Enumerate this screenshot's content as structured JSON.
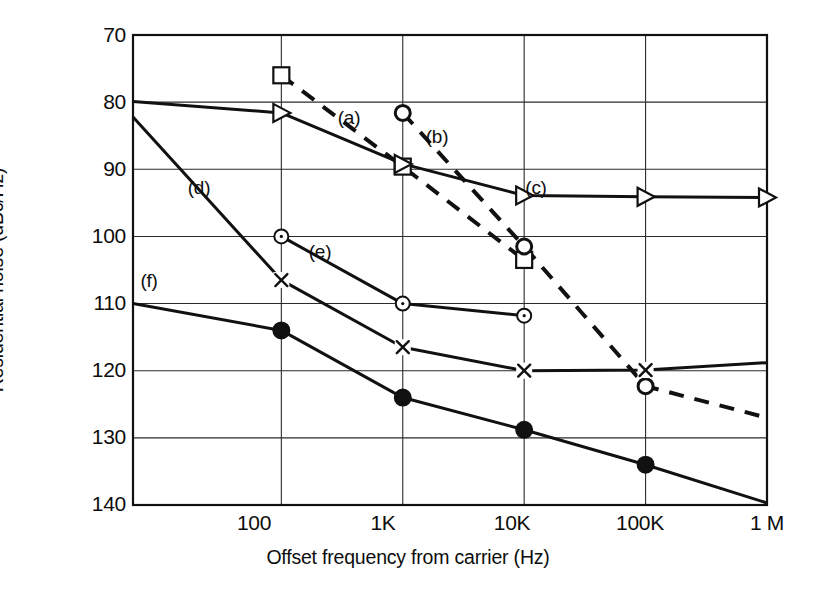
{
  "chart_data": {
    "type": "line",
    "title": "",
    "xlabel": "Offset frequency from carrier (Hz)",
    "ylabel": "Residential noise (dBc/Hz)",
    "x_scale": "log",
    "x_tick_labels": [
      "100",
      "1K",
      "10K",
      "100K",
      "1 M"
    ],
    "x_tick_values": [
      100,
      1000,
      10000,
      100000,
      1000000
    ],
    "xlim": [
      6,
      1000000
    ],
    "y_tick_labels": [
      "70",
      "80",
      "90",
      "100",
      "110",
      "120",
      "130",
      "140"
    ],
    "y_tick_values": [
      70,
      80,
      90,
      100,
      110,
      120,
      130,
      140
    ],
    "ylim": [
      70,
      140
    ],
    "y_inverted": true,
    "grid": true,
    "legend": "inline-annotations",
    "series": [
      {
        "name": "(a)",
        "label": "(a)",
        "marker": "square-open",
        "line": "dashed",
        "x": [
          100,
          1000,
          10000
        ],
        "values": [
          76.0,
          89.6,
          103.5
        ]
      },
      {
        "name": "(b)",
        "label": "(b)",
        "marker": "circle-open",
        "line": "dashed",
        "x": [
          1000,
          10000,
          100000,
          1000000
        ],
        "values": [
          81.6,
          101.5,
          122.3,
          127.0
        ]
      },
      {
        "name": "(c)",
        "label": "(c)",
        "marker": "triangle-right-open",
        "line": "solid",
        "x": [
          6,
          100,
          1000,
          10000,
          100000,
          1000000
        ],
        "values": [
          79.9,
          81.6,
          89.2,
          93.9,
          94.1,
          94.2
        ]
      },
      {
        "name": "(d)",
        "label": "(d)",
        "marker": "x",
        "line": "solid",
        "x": [
          6,
          100,
          1000,
          10000,
          100000,
          1000000
        ],
        "values": [
          82.2,
          106.5,
          116.5,
          120.0,
          119.9,
          118.8
        ]
      },
      {
        "name": "(e)",
        "label": "(e)",
        "marker": "circle-open-small",
        "line": "solid",
        "x": [
          100,
          1000,
          10000
        ],
        "values": [
          100.0,
          110.0,
          111.8
        ]
      },
      {
        "name": "(f)",
        "label": "(f)",
        "marker": "circle-filled",
        "line": "solid",
        "x": [
          6,
          100,
          1000,
          10000,
          100000,
          1000000
        ],
        "values": [
          110.0,
          114.0,
          124.0,
          128.8,
          134.0,
          139.7
        ]
      }
    ],
    "annotations": [
      {
        "text": "(a)",
        "x_px": 349,
        "y_px": 118
      },
      {
        "text": "(b)",
        "x_px": 437,
        "y_px": 137
      },
      {
        "text": "(c)",
        "x_px": 536,
        "y_px": 188
      },
      {
        "text": "(d)",
        "x_px": 199,
        "y_px": 188
      },
      {
        "text": "(e)",
        "x_px": 320,
        "y_px": 252
      },
      {
        "text": "(f)",
        "x_px": 149,
        "y_px": 281
      }
    ]
  }
}
